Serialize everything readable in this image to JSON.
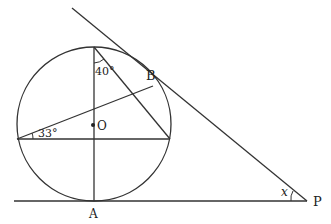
{
  "diagram": {
    "type": "circle-geometry",
    "stroke_color": "#333333",
    "background": "#ffffff",
    "points": {
      "O": {
        "label": "O",
        "x": 94,
        "y": 125
      },
      "A": {
        "label": "A",
        "x": 94,
        "y": 201
      },
      "B": {
        "label": "B",
        "x": 153,
        "y": 86
      },
      "P": {
        "label": "P",
        "x": 307,
        "y": 201
      },
      "top": {
        "x": 94,
        "y": 47
      },
      "left": {
        "x": 17,
        "y": 139
      },
      "right": {
        "x": 172,
        "y": 139
      }
    },
    "angles": {
      "top_angle": "40°",
      "left_angle": "33°",
      "p_angle": "x"
    },
    "labels": {
      "O": "O",
      "A": "A",
      "B": "B",
      "P": "P"
    }
  }
}
